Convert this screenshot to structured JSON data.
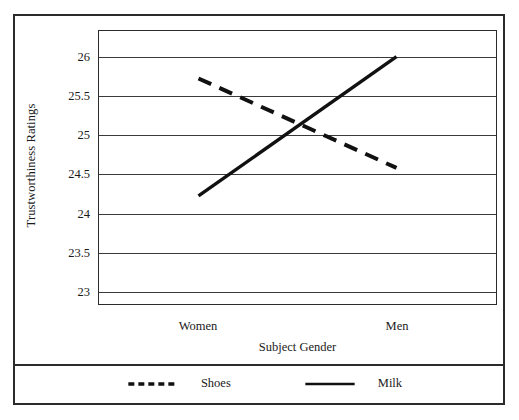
{
  "chart_data": {
    "type": "line",
    "title": "",
    "xlabel": "Subject Gender",
    "ylabel": "Trustworthiness Ratings",
    "categories": [
      "Women",
      "Men"
    ],
    "series": [
      {
        "name": "Shoes",
        "style": "dashed",
        "color": "#111111",
        "values": [
          25.72,
          24.57
        ]
      },
      {
        "name": "Milk",
        "style": "solid",
        "color": "#111111",
        "values": [
          24.21,
          26.0
        ]
      }
    ],
    "ylim": [
      22.82,
      26.33
    ],
    "yticks": [
      23,
      23.5,
      24,
      24.5,
      25,
      25.5,
      26
    ],
    "ytick_labels": [
      "23",
      "23.5",
      "24",
      "24.5",
      "25",
      "25.5",
      "26"
    ],
    "grid": "horizontal",
    "legend_position": "bottom"
  },
  "legend": {
    "entries": [
      {
        "label": "Shoes",
        "swatch": "dashed-line-swatch"
      },
      {
        "label": "Milk",
        "swatch": "solid-line-swatch"
      }
    ]
  }
}
